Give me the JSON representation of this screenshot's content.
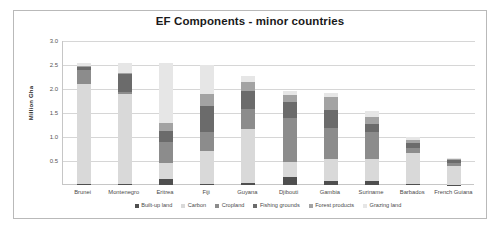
{
  "frame": {
    "border_color": "#b9b9b9"
  },
  "chart_data": {
    "type": "bar",
    "subtype": "stacked-bar",
    "title": "EF Components - minor countries",
    "xlabel": "",
    "ylabel": "Million Gha",
    "ylim": [
      0,
      3.0
    ],
    "yticks": [
      "0.5",
      "1.0",
      "1.5",
      "2.0",
      "2.5",
      "3.0"
    ],
    "ytick_values": [
      0.5,
      1.0,
      1.5,
      2.0,
      2.5,
      3.0
    ],
    "grid": true,
    "legend_position": "bottom",
    "categories": [
      "Brunei",
      "Montenegro",
      "Eritrea",
      "Fiji",
      "Guyana",
      "Djibouti",
      "Gambia",
      "Suriname",
      "Barbados",
      "French Guiana"
    ],
    "series": [
      {
        "name": "Built-up land",
        "color": "#4f4f4f",
        "values": [
          0.02,
          0.02,
          0.12,
          0.03,
          0.04,
          0.16,
          0.09,
          0.08,
          0.02,
          0.01
        ]
      },
      {
        "name": "Carbon",
        "color": "#d9d9d9",
        "values": [
          2.08,
          1.88,
          0.33,
          0.67,
          1.12,
          0.33,
          0.45,
          0.47,
          0.64,
          0.38
        ]
      },
      {
        "name": "Cropland",
        "color": "#8c8c8c",
        "values": [
          0.3,
          0.03,
          0.45,
          0.4,
          0.42,
          0.9,
          0.65,
          0.55,
          0.12,
          0.06
        ]
      },
      {
        "name": "Fishing grounds",
        "color": "#6b6b6b",
        "values": [
          0.05,
          0.38,
          0.22,
          0.55,
          0.38,
          0.33,
          0.38,
          0.17,
          0.1,
          0.07
        ]
      },
      {
        "name": "Forest products",
        "color": "#a3a3a3",
        "values": [
          0.03,
          0.02,
          0.18,
          0.24,
          0.18,
          0.15,
          0.27,
          0.14,
          0.06,
          0.02
        ]
      },
      {
        "name": "Grazing land",
        "color": "#e6e6e6",
        "values": [
          0.07,
          0.22,
          1.25,
          0.61,
          0.13,
          0.08,
          0.07,
          0.14,
          0.06,
          0.03
        ]
      }
    ],
    "totals": [
      2.55,
      2.55,
      2.55,
      2.5,
      2.27,
      1.95,
      1.91,
      1.55,
      1.0,
      0.57
    ]
  }
}
